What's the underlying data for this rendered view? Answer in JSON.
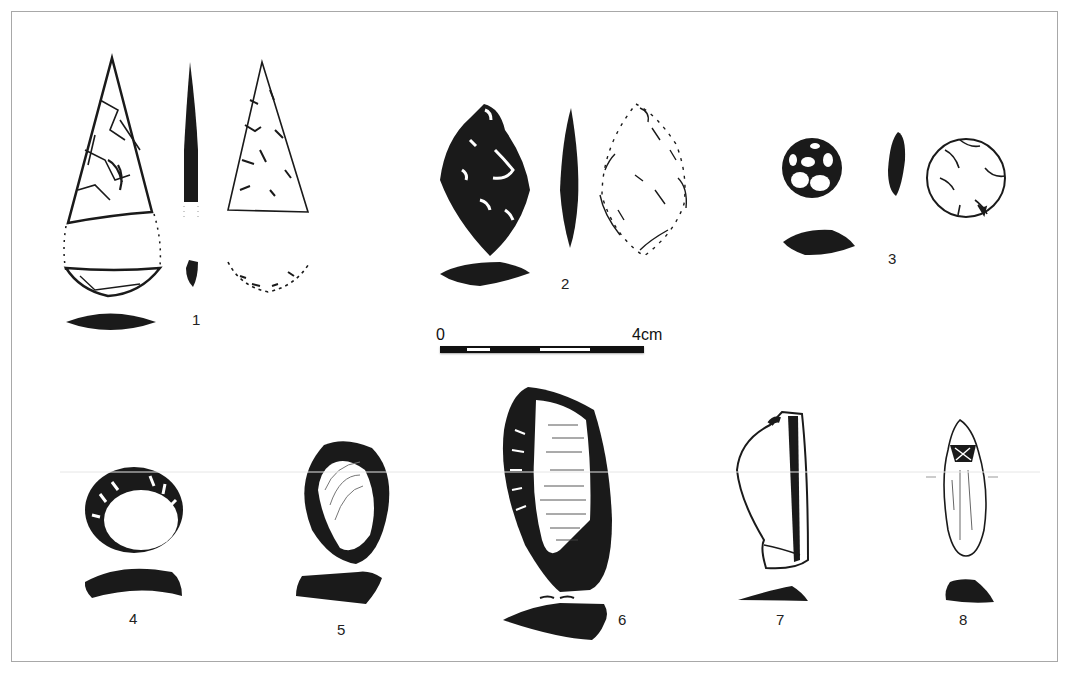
{
  "figure": {
    "type": "archaeological lithic artifact plate",
    "colors": {
      "ink": "#1a1a1a",
      "frame": "#a8a8a8",
      "background": "#ffffff"
    },
    "labels": [
      {
        "id": 1,
        "text": "1"
      },
      {
        "id": 2,
        "text": "2"
      },
      {
        "id": 3,
        "text": "3"
      },
      {
        "id": 4,
        "text": "4"
      },
      {
        "id": 5,
        "text": "5"
      },
      {
        "id": 6,
        "text": "6"
      },
      {
        "id": 7,
        "text": "7"
      },
      {
        "id": 8,
        "text": "8"
      }
    ],
    "scale": {
      "start_label": "0",
      "end_label": "4cm",
      "segments": [
        "black",
        "white",
        "black",
        "white",
        "black"
      ],
      "segment_widths_px": [
        27,
        23,
        50,
        50,
        54
      ]
    }
  }
}
